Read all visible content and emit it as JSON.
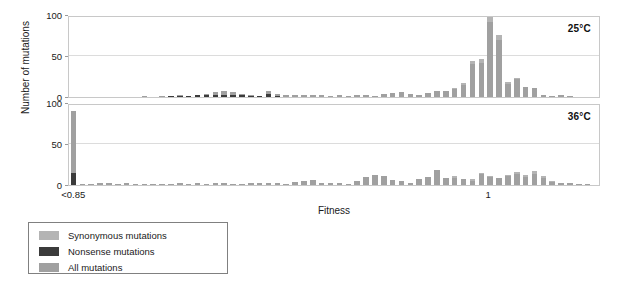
{
  "figure": {
    "y_axis_title": "Number of mutations",
    "x_axis_title": "Fitness"
  },
  "panels": [
    {
      "id": "top",
      "temperature_label": "25°C"
    },
    {
      "id": "bottom",
      "temperature_label": "36°C"
    }
  ],
  "y_ticks": [
    "0",
    "50",
    "100"
  ],
  "x_ticks": [
    {
      "label": "<0.85",
      "position_pct": 1.0
    },
    {
      "label": "1",
      "position_pct": 79.0
    }
  ],
  "legend": {
    "items": [
      {
        "label": "Synonymous mutations",
        "color": "#b4b4b4"
      },
      {
        "label": "Nonsense mutations",
        "color": "#3b3b3b"
      },
      {
        "label": "All mutations",
        "color": "#a0a0a0"
      }
    ]
  },
  "colors": {
    "synonymous": "#b4b4b4",
    "nonsense": "#3b3b3b",
    "all": "#a0a0a0",
    "axis": "#c8c8c8",
    "gridline": "#dcdcdc"
  },
  "chart_data": {
    "type": "bar",
    "title": "",
    "subtitle": "",
    "xlabel": "Fitness",
    "ylabel": "Number of mutations",
    "ylim": [
      0,
      100
    ],
    "y_ticks": [
      0,
      50,
      100
    ],
    "grid": true,
    "legend_position": "below-left",
    "stacked": true,
    "bin_count": 60,
    "x_first_bin_label": "<0.85",
    "x_tick_at_one_bin_index": 47,
    "series_names": [
      "All mutations",
      "Nonsense mutations",
      "Synonymous mutations"
    ],
    "panels": [
      {
        "name": "25°C",
        "bins": [
          {
            "i": 0,
            "all": 0,
            "nonsense": 0,
            "synonymous": 0
          },
          {
            "i": 1,
            "all": 0,
            "nonsense": 0,
            "synonymous": 0
          },
          {
            "i": 2,
            "all": 0,
            "nonsense": 0,
            "synonymous": 0
          },
          {
            "i": 3,
            "all": 0,
            "nonsense": 0,
            "synonymous": 0
          },
          {
            "i": 4,
            "all": 0,
            "nonsense": 0,
            "synonymous": 0
          },
          {
            "i": 5,
            "all": 0,
            "nonsense": 0,
            "synonymous": 0
          },
          {
            "i": 6,
            "all": 0,
            "nonsense": 0,
            "synonymous": 0
          },
          {
            "i": 7,
            "all": 0,
            "nonsense": 0,
            "synonymous": 0
          },
          {
            "i": 8,
            "all": 1,
            "nonsense": 0,
            "synonymous": 0
          },
          {
            "i": 9,
            "all": 0,
            "nonsense": 0,
            "synonymous": 0
          },
          {
            "i": 10,
            "all": 1,
            "nonsense": 0,
            "synonymous": 0
          },
          {
            "i": 11,
            "all": 1,
            "nonsense": 1,
            "synonymous": 0
          },
          {
            "i": 12,
            "all": 2,
            "nonsense": 1,
            "synonymous": 0
          },
          {
            "i": 13,
            "all": 1,
            "nonsense": 1,
            "synonymous": 0
          },
          {
            "i": 14,
            "all": 3,
            "nonsense": 2,
            "synonymous": 0
          },
          {
            "i": 15,
            "all": 5,
            "nonsense": 2,
            "synonymous": 1
          },
          {
            "i": 16,
            "all": 7,
            "nonsense": 2,
            "synonymous": 1
          },
          {
            "i": 17,
            "all": 8,
            "nonsense": 2,
            "synonymous": 1
          },
          {
            "i": 18,
            "all": 7,
            "nonsense": 2,
            "synonymous": 1
          },
          {
            "i": 19,
            "all": 4,
            "nonsense": 2,
            "synonymous": 0
          },
          {
            "i": 20,
            "all": 2,
            "nonsense": 1,
            "synonymous": 0
          },
          {
            "i": 21,
            "all": 1,
            "nonsense": 1,
            "synonymous": 0
          },
          {
            "i": 22,
            "all": 9,
            "nonsense": 4,
            "synonymous": 2
          },
          {
            "i": 23,
            "all": 4,
            "nonsense": 1,
            "synonymous": 0
          },
          {
            "i": 24,
            "all": 3,
            "nonsense": 0,
            "synonymous": 0
          },
          {
            "i": 25,
            "all": 2,
            "nonsense": 0,
            "synonymous": 0
          },
          {
            "i": 26,
            "all": 3,
            "nonsense": 0,
            "synonymous": 0
          },
          {
            "i": 27,
            "all": 2,
            "nonsense": 0,
            "synonymous": 0
          },
          {
            "i": 28,
            "all": 2,
            "nonsense": 0,
            "synonymous": 0
          },
          {
            "i": 29,
            "all": 1,
            "nonsense": 0,
            "synonymous": 0
          },
          {
            "i": 30,
            "all": 2,
            "nonsense": 0,
            "synonymous": 0
          },
          {
            "i": 31,
            "all": 1,
            "nonsense": 0,
            "synonymous": 0
          },
          {
            "i": 32,
            "all": 3,
            "nonsense": 0,
            "synonymous": 0
          },
          {
            "i": 33,
            "all": 2,
            "nonsense": 0,
            "synonymous": 0
          },
          {
            "i": 34,
            "all": 1,
            "nonsense": 0,
            "synonymous": 0
          },
          {
            "i": 35,
            "all": 4,
            "nonsense": 0,
            "synonymous": 0
          },
          {
            "i": 36,
            "all": 5,
            "nonsense": 0,
            "synonymous": 0
          },
          {
            "i": 37,
            "all": 6,
            "nonsense": 0,
            "synonymous": 0
          },
          {
            "i": 38,
            "all": 4,
            "nonsense": 0,
            "synonymous": 0
          },
          {
            "i": 39,
            "all": 3,
            "nonsense": 0,
            "synonymous": 0
          },
          {
            "i": 40,
            "all": 6,
            "nonsense": 0,
            "synonymous": 1
          },
          {
            "i": 41,
            "all": 8,
            "nonsense": 0,
            "synonymous": 1
          },
          {
            "i": 42,
            "all": 9,
            "nonsense": 0,
            "synonymous": 2
          },
          {
            "i": 43,
            "all": 12,
            "nonsense": 0,
            "synonymous": 2
          },
          {
            "i": 44,
            "all": 18,
            "nonsense": 0,
            "synonymous": 3
          },
          {
            "i": 45,
            "all": 45,
            "nonsense": 0,
            "synonymous": 5
          },
          {
            "i": 46,
            "all": 48,
            "nonsense": 0,
            "synonymous": 6
          },
          {
            "i": 47,
            "all": 100,
            "nonsense": 0,
            "synonymous": 9
          },
          {
            "i": 48,
            "all": 77,
            "nonsense": 0,
            "synonymous": 8
          },
          {
            "i": 49,
            "all": 20,
            "nonsense": 0,
            "synonymous": 4
          },
          {
            "i": 50,
            "all": 25,
            "nonsense": 0,
            "synonymous": 3
          },
          {
            "i": 51,
            "all": 14,
            "nonsense": 0,
            "synonymous": 2
          },
          {
            "i": 52,
            "all": 12,
            "nonsense": 0,
            "synonymous": 1
          },
          {
            "i": 53,
            "all": 3,
            "nonsense": 0,
            "synonymous": 0
          },
          {
            "i": 54,
            "all": 1,
            "nonsense": 0,
            "synonymous": 0
          },
          {
            "i": 55,
            "all": 2,
            "nonsense": 0,
            "synonymous": 0
          },
          {
            "i": 56,
            "all": 1,
            "nonsense": 0,
            "synonymous": 0
          },
          {
            "i": 57,
            "all": 0,
            "nonsense": 0,
            "synonymous": 0
          },
          {
            "i": 58,
            "all": 0,
            "nonsense": 0,
            "synonymous": 0
          },
          {
            "i": 59,
            "all": 0,
            "nonsense": 0,
            "synonymous": 0
          }
        ]
      },
      {
        "name": "36°C",
        "bins": [
          {
            "i": 0,
            "all": 90,
            "nonsense": 15,
            "synonymous": 0
          },
          {
            "i": 1,
            "all": 1,
            "nonsense": 0,
            "synonymous": 0
          },
          {
            "i": 2,
            "all": 1,
            "nonsense": 0,
            "synonymous": 0
          },
          {
            "i": 3,
            "all": 2,
            "nonsense": 0,
            "synonymous": 0
          },
          {
            "i": 4,
            "all": 2,
            "nonsense": 0,
            "synonymous": 0
          },
          {
            "i": 5,
            "all": 1,
            "nonsense": 0,
            "synonymous": 0
          },
          {
            "i": 6,
            "all": 2,
            "nonsense": 0,
            "synonymous": 0
          },
          {
            "i": 7,
            "all": 1,
            "nonsense": 0,
            "synonymous": 0
          },
          {
            "i": 8,
            "all": 1,
            "nonsense": 0,
            "synonymous": 0
          },
          {
            "i": 9,
            "all": 1,
            "nonsense": 0,
            "synonymous": 0
          },
          {
            "i": 10,
            "all": 1,
            "nonsense": 0,
            "synonymous": 0
          },
          {
            "i": 11,
            "all": 1,
            "nonsense": 0,
            "synonymous": 0
          },
          {
            "i": 12,
            "all": 2,
            "nonsense": 0,
            "synonymous": 0
          },
          {
            "i": 13,
            "all": 1,
            "nonsense": 0,
            "synonymous": 0
          },
          {
            "i": 14,
            "all": 2,
            "nonsense": 0,
            "synonymous": 0
          },
          {
            "i": 15,
            "all": 1,
            "nonsense": 0,
            "synonymous": 0
          },
          {
            "i": 16,
            "all": 2,
            "nonsense": 0,
            "synonymous": 0
          },
          {
            "i": 17,
            "all": 2,
            "nonsense": 0,
            "synonymous": 0
          },
          {
            "i": 18,
            "all": 1,
            "nonsense": 0,
            "synonymous": 0
          },
          {
            "i": 19,
            "all": 1,
            "nonsense": 0,
            "synonymous": 0
          },
          {
            "i": 20,
            "all": 2,
            "nonsense": 0,
            "synonymous": 0
          },
          {
            "i": 21,
            "all": 3,
            "nonsense": 0,
            "synonymous": 0
          },
          {
            "i": 22,
            "all": 2,
            "nonsense": 0,
            "synonymous": 0
          },
          {
            "i": 23,
            "all": 2,
            "nonsense": 0,
            "synonymous": 0
          },
          {
            "i": 24,
            "all": 1,
            "nonsense": 0,
            "synonymous": 0
          },
          {
            "i": 25,
            "all": 4,
            "nonsense": 0,
            "synonymous": 0
          },
          {
            "i": 26,
            "all": 5,
            "nonsense": 0,
            "synonymous": 0
          },
          {
            "i": 27,
            "all": 6,
            "nonsense": 0,
            "synonymous": 0
          },
          {
            "i": 28,
            "all": 3,
            "nonsense": 0,
            "synonymous": 0
          },
          {
            "i": 29,
            "all": 2,
            "nonsense": 0,
            "synonymous": 0
          },
          {
            "i": 30,
            "all": 2,
            "nonsense": 0,
            "synonymous": 0
          },
          {
            "i": 31,
            "all": 1,
            "nonsense": 0,
            "synonymous": 0
          },
          {
            "i": 32,
            "all": 5,
            "nonsense": 0,
            "synonymous": 0
          },
          {
            "i": 33,
            "all": 11,
            "nonsense": 0,
            "synonymous": 1
          },
          {
            "i": 34,
            "all": 13,
            "nonsense": 0,
            "synonymous": 1
          },
          {
            "i": 35,
            "all": 12,
            "nonsense": 0,
            "synonymous": 1
          },
          {
            "i": 36,
            "all": 6,
            "nonsense": 0,
            "synonymous": 0
          },
          {
            "i": 37,
            "all": 5,
            "nonsense": 0,
            "synonymous": 0
          },
          {
            "i": 38,
            "all": 3,
            "nonsense": 0,
            "synonymous": 0
          },
          {
            "i": 39,
            "all": 9,
            "nonsense": 0,
            "synonymous": 1
          },
          {
            "i": 40,
            "all": 11,
            "nonsense": 0,
            "synonymous": 1
          },
          {
            "i": 41,
            "all": 20,
            "nonsense": 0,
            "synonymous": 2
          },
          {
            "i": 42,
            "all": 10,
            "nonsense": 0,
            "synonymous": 2
          },
          {
            "i": 43,
            "all": 12,
            "nonsense": 0,
            "synonymous": 3
          },
          {
            "i": 44,
            "all": 9,
            "nonsense": 0,
            "synonymous": 2
          },
          {
            "i": 45,
            "all": 8,
            "nonsense": 0,
            "synonymous": 3
          },
          {
            "i": 46,
            "all": 16,
            "nonsense": 0,
            "synonymous": 3
          },
          {
            "i": 47,
            "all": 12,
            "nonsense": 0,
            "synonymous": 2
          },
          {
            "i": 48,
            "all": 10,
            "nonsense": 0,
            "synonymous": 2
          },
          {
            "i": 49,
            "all": 14,
            "nonsense": 0,
            "synonymous": 3
          },
          {
            "i": 50,
            "all": 17,
            "nonsense": 0,
            "synonymous": 3
          },
          {
            "i": 51,
            "all": 13,
            "nonsense": 0,
            "synonymous": 3
          },
          {
            "i": 52,
            "all": 18,
            "nonsense": 0,
            "synonymous": 4
          },
          {
            "i": 53,
            "all": 12,
            "nonsense": 0,
            "synonymous": 3
          },
          {
            "i": 54,
            "all": 6,
            "nonsense": 0,
            "synonymous": 2
          },
          {
            "i": 55,
            "all": 4,
            "nonsense": 0,
            "synonymous": 1
          },
          {
            "i": 56,
            "all": 2,
            "nonsense": 0,
            "synonymous": 0
          },
          {
            "i": 57,
            "all": 1,
            "nonsense": 0,
            "synonymous": 0
          },
          {
            "i": 58,
            "all": 1,
            "nonsense": 0,
            "synonymous": 0
          },
          {
            "i": 59,
            "all": 0,
            "nonsense": 0,
            "synonymous": 0
          }
        ]
      }
    ]
  }
}
